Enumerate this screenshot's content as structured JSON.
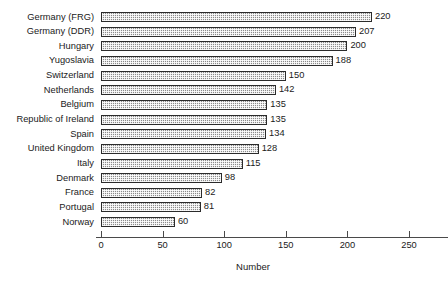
{
  "chart_data": {
    "type": "bar",
    "orientation": "horizontal",
    "title": "",
    "xlabel": "Number",
    "ylabel": "",
    "xlim": [
      0,
      250
    ],
    "xticks": [
      0,
      50,
      100,
      150,
      200,
      250
    ],
    "grid": false,
    "legend": null,
    "categories": [
      "Germany (FRG)",
      "Germany (DDR)",
      "Hungary",
      "Yugoslavia",
      "Switzerland",
      "Netherlands",
      "Belgium",
      "Republic of Ireland",
      "Spain",
      "United Kingdom",
      "Italy",
      "Denmark",
      "France",
      "Portugal",
      "Norway"
    ],
    "values": [
      220,
      207,
      200,
      188,
      150,
      142,
      135,
      135,
      134,
      128,
      115,
      98,
      82,
      81,
      60
    ],
    "value_labels": [
      "220",
      "207",
      "200",
      "188",
      "150",
      "142",
      "135",
      "135",
      "134",
      "128",
      "115",
      "98",
      "82",
      "81",
      "60"
    ],
    "colors": {
      "bar_fill": "#b6b6b6",
      "bar_border": "#2b2b2b",
      "axis": "#4a4a4a",
      "text": "#1a1a1a",
      "background": "#ffffff"
    }
  }
}
